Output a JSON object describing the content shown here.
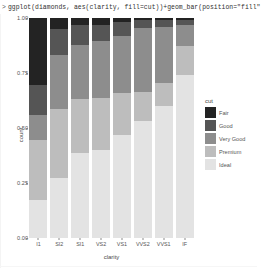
{
  "console": {
    "prompt": ">",
    "command": "ggplot(diamonds, aes(clarity, fill=cut))+geom_bar(position=\"fill\""
  },
  "legend": {
    "title": "cut",
    "entries": [
      {
        "label": "Fair",
        "color": "#232323"
      },
      {
        "label": "Good",
        "color": "#555555"
      },
      {
        "label": "Very Good",
        "color": "#8d8d8d"
      },
      {
        "label": "Premium",
        "color": "#bdbdbd"
      },
      {
        "label": "Ideal",
        "color": "#e3e3e3"
      }
    ]
  },
  "axes": {
    "ylabel": "count",
    "xlabel": "clarity",
    "yticks": [
      "1.00",
      "0.75",
      "0.50",
      "0.25",
      "0.00"
    ]
  },
  "chart_data": {
    "type": "bar",
    "title": "",
    "xlabel": "clarity",
    "ylabel": "count",
    "ylim": [
      0,
      1
    ],
    "grid": false,
    "stacked": true,
    "position": "fill",
    "legend_position": "right",
    "legend_title": "cut",
    "categories": [
      "I1",
      "SI2",
      "SI1",
      "VS2",
      "VS1",
      "VVS2",
      "VVS1",
      "IF"
    ],
    "tick_labels": {
      "x": [
        "I1",
        "SI2",
        "SI1",
        "VS2",
        "VS1",
        "VVS2",
        "VVS1",
        "IF"
      ],
      "y": [
        "0.00",
        "0.25",
        "0.50",
        "0.75",
        "1.00"
      ]
    },
    "series": [
      {
        "name": "Fair",
        "color": "#232323",
        "values": [
          0.304,
          0.051,
          0.033,
          0.03,
          0.02,
          0.011,
          0.01,
          0.007
        ]
      },
      {
        "name": "Good",
        "color": "#555555",
        "values": [
          0.136,
          0.116,
          0.09,
          0.075,
          0.064,
          0.035,
          0.033,
          0.024
        ]
      },
      {
        "name": "Very Good",
        "color": "#8d8d8d",
        "values": [
          0.115,
          0.245,
          0.247,
          0.26,
          0.258,
          0.29,
          0.253,
          0.097
        ]
      },
      {
        "name": "Premium",
        "color": "#bdbdbd",
        "values": [
          0.274,
          0.314,
          0.242,
          0.234,
          0.19,
          0.133,
          0.103,
          0.13
        ]
      },
      {
        "name": "Ideal",
        "color": "#e3e3e3",
        "values": [
          0.171,
          0.274,
          0.388,
          0.401,
          0.468,
          0.531,
          0.601,
          0.742
        ]
      }
    ]
  }
}
